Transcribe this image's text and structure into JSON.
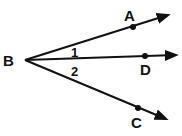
{
  "diagram": {
    "type": "angle-rays",
    "vertex": {
      "label": "B",
      "x": 25,
      "y": 60
    },
    "rays": [
      {
        "name": "BA",
        "point_label": "A",
        "point": [
          133,
          27
        ],
        "end": [
          168,
          15
        ]
      },
      {
        "name": "BD",
        "point_label": "D",
        "point": [
          145,
          56
        ],
        "end": [
          176,
          55
        ]
      },
      {
        "name": "BC",
        "point_label": "C",
        "point": [
          138,
          108
        ],
        "end": [
          166,
          119
        ]
      }
    ],
    "angles": [
      {
        "label": "1",
        "between": [
          "BA",
          "BD"
        ]
      },
      {
        "label": "2",
        "between": [
          "BD",
          "BC"
        ]
      }
    ],
    "colors": {
      "line": "#111111",
      "background": "#ffffff"
    }
  },
  "labels": {
    "B": "B",
    "A": "A",
    "D": "D",
    "C": "C",
    "angle1": "1",
    "angle2": "2"
  }
}
